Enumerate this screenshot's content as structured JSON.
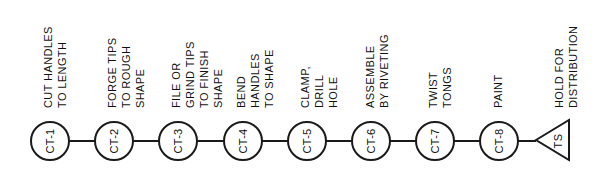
{
  "diagram": {
    "type": "process-flow",
    "orientation": "horizontal",
    "steps": [
      {
        "id": "CT-1",
        "x": 50,
        "lines": [
          "CUT HANDLES",
          "TO LENGTH"
        ]
      },
      {
        "id": "CT-2",
        "x": 114,
        "lines": [
          "FORGE TIPS",
          "TO ROUGH",
          "SHAPE"
        ]
      },
      {
        "id": "CT-3",
        "x": 178,
        "lines": [
          "FILE OR",
          "GRIND TIPS",
          "TO FINISH",
          "SHAPE"
        ]
      },
      {
        "id": "CT-4",
        "x": 243,
        "lines": [
          "BEND",
          "HANDLES",
          "TO SHAPE"
        ]
      },
      {
        "id": "CT-5",
        "x": 307,
        "lines": [
          "CLAMP,",
          "DRILL",
          "HOLE"
        ]
      },
      {
        "id": "CT-6",
        "x": 371,
        "lines": [
          "ASSEMBLE",
          "BY RIVETING"
        ]
      },
      {
        "id": "CT-7",
        "x": 435,
        "lines": [
          "TWIST",
          "TONGS"
        ]
      },
      {
        "id": "CT-8",
        "x": 499,
        "lines": [
          "PAINT"
        ]
      }
    ],
    "terminal": {
      "id": "TS",
      "shape": "triangle",
      "lines": [
        "HOLD FOR",
        "DISTRIBUTION"
      ]
    },
    "colors": {
      "stroke": "#1a1a1a",
      "background": "#ffffff"
    }
  }
}
